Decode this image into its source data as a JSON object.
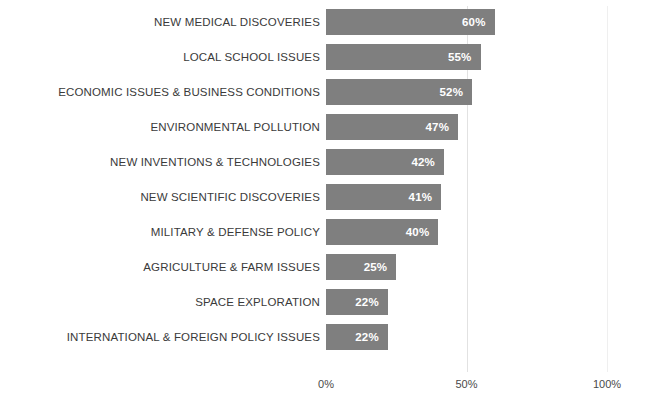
{
  "chart_data": {
    "type": "bar",
    "orientation": "horizontal",
    "title": "",
    "subtitle": "",
    "xlabel": "",
    "ylabel": "",
    "xlim": [
      0,
      100
    ],
    "grid": true,
    "legend": null,
    "legend_position": "none",
    "bar_color": "#7f7f7f",
    "value_label_color": "#ffffff",
    "category_label_color": "#3a3a3a",
    "gridline_color": "#e2e2e2",
    "categories": [
      "NEW MEDICAL DISCOVERIES",
      "LOCAL SCHOOL ISSUES",
      "ECONOMIC ISSUES & BUSINESS CONDITIONS",
      "ENVIRONMENTAL POLLUTION",
      "NEW INVENTIONS & TECHNOLOGIES",
      "NEW SCIENTIFIC DISCOVERIES",
      "MILITARY & DEFENSE POLICY",
      "AGRICULTURE & FARM ISSUES",
      "SPACE EXPLORATION",
      "INTERNATIONAL & FOREIGN POLICY ISSUES"
    ],
    "values": [
      60,
      55,
      52,
      47,
      42,
      41,
      40,
      25,
      22,
      22
    ],
    "value_labels": [
      "60%",
      "55%",
      "52%",
      "47%",
      "42%",
      "41%",
      "40%",
      "25%",
      "22%",
      "22%"
    ],
    "xticks": [
      0,
      50,
      100
    ],
    "xtick_labels": [
      "0%",
      "50%",
      "100%"
    ]
  }
}
